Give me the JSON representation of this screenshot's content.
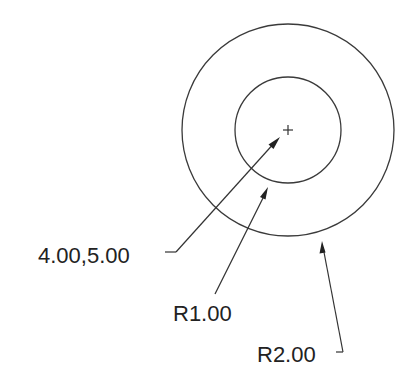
{
  "diagram": {
    "type": "cad-dimensioned-circles",
    "colors": {
      "line": "#3a3a3a",
      "text": "#222222",
      "background": "#ffffff"
    },
    "center_mark": {
      "x": 288,
      "y": 130,
      "symbol": "+"
    },
    "circles": [
      {
        "name": "inner-circle",
        "cx": 288,
        "cy": 130,
        "r": 53
      },
      {
        "name": "outer-circle",
        "cx": 288,
        "cy": 130,
        "r": 106
      }
    ],
    "annotations": [
      {
        "name": "center-coordinate",
        "label": "4.00,5.00",
        "text_x": 38,
        "text_y": 263,
        "leader": {
          "tick": [
            165,
            252,
            176,
            252
          ],
          "from": [
            176,
            252
          ],
          "to": [
            279,
            138
          ]
        }
      },
      {
        "name": "inner-radius",
        "label": "R1.00",
        "text_x": 173,
        "text_y": 321,
        "leader": {
          "from": [
            215,
            294
          ],
          "to": [
            268,
            188
          ]
        }
      },
      {
        "name": "outer-radius",
        "label": "R2.00",
        "text_x": 257,
        "text_y": 362,
        "leader": {
          "tick": [
            336,
            352,
            343,
            352
          ],
          "from": [
            343,
            352
          ],
          "to": [
            322,
            242
          ]
        }
      }
    ]
  }
}
